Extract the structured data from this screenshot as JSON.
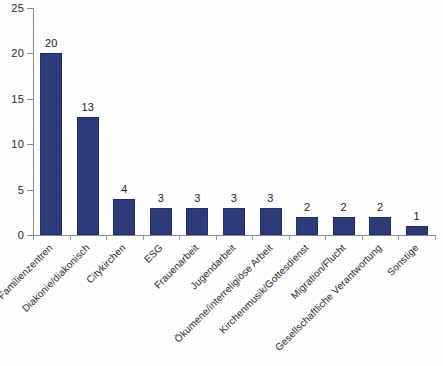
{
  "chart_data": {
    "type": "bar",
    "title": "",
    "subtitle": "",
    "xlabel": "",
    "ylabel": "",
    "ylim": [
      0,
      25
    ],
    "ytick_values": [
      0,
      5,
      10,
      15,
      20,
      25
    ],
    "ytick_labels": [
      "0",
      "5",
      "10",
      "15",
      "20",
      "25"
    ],
    "grid": false,
    "legend": false,
    "legend_position": "none",
    "orientation": "vertical",
    "bar_color": "#2d3b7c",
    "label_rotation_deg": -45,
    "categories": [
      "Familienzentren",
      "Diakonie/diakonisch",
      "Citykirchen",
      "ESG",
      "Frauenarbeit",
      "Jugendarbeit",
      "Ökumene/interreligiöse Arbeit",
      "Kirchenmusik/Gottesdienst",
      "Migration/Flucht",
      "Gesellschaftliche Verantwortung",
      "Sonstige"
    ],
    "values": [
      20,
      13,
      4,
      3,
      3,
      3,
      3,
      2,
      2,
      2,
      1
    ],
    "data_labels": [
      "20",
      "13",
      "4",
      "3",
      "3",
      "3",
      "3",
      "2",
      "2",
      "2",
      "1"
    ]
  },
  "colors": {
    "bar": "#2d3b7c",
    "bar_border": "#222c5e",
    "axis": "#8c8c8c",
    "text": "#2a2a2a",
    "background": "#ffffff"
  }
}
